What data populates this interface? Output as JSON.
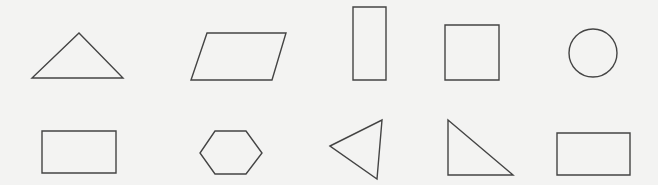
{
  "canvas": {
    "width": 658,
    "height": 185,
    "background": "#f3f3f2",
    "stroke": "#444444"
  },
  "rows": [
    {
      "shapes": [
        {
          "name": "triangle-isosceles",
          "type": "polygon",
          "points": "79,33 123,78 32,78"
        },
        {
          "name": "parallelogram",
          "type": "polygon",
          "points": "207,33 286,33 272,80 191,80"
        },
        {
          "name": "rectangle-tall",
          "type": "polygon",
          "points": "353,7 386,7 386,80 353,80"
        },
        {
          "name": "square",
          "type": "polygon",
          "points": "445,25 499,25 499,80 445,80"
        },
        {
          "name": "circle",
          "type": "circle",
          "cx": 593,
          "cy": 53,
          "r": 24
        }
      ]
    },
    {
      "shapes": [
        {
          "name": "rectangle-wide",
          "type": "polygon",
          "points": "42,131 116,131 116,173 42,173"
        },
        {
          "name": "hexagon",
          "type": "polygon",
          "points": "215,131 246,131 262,153 246,174 215,174 200,153"
        },
        {
          "name": "triangle-scalene",
          "type": "polygon",
          "points": "330,146 382,120 377,179"
        },
        {
          "name": "triangle-right",
          "type": "polygon",
          "points": "448,120 513,175 448,175"
        },
        {
          "name": "rectangle-wide-2",
          "type": "polygon",
          "points": "557,133 630,133 630,175 557,175"
        }
      ]
    }
  ]
}
